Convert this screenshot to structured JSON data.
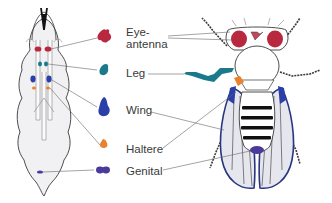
{
  "figure": {
    "left_panel": "larva",
    "right_panel": "adult fly"
  },
  "discs": [
    {
      "id": "eye-antenna",
      "label_line1": "Eye-",
      "label_line2": "antenna",
      "color": "#b8283e"
    },
    {
      "id": "leg",
      "label": "Leg",
      "color": "#1a7a8c"
    },
    {
      "id": "wing",
      "label": "Wing",
      "color": "#2a3fa8"
    },
    {
      "id": "haltere",
      "label": "Haltere",
      "color": "#e8822e"
    },
    {
      "id": "genital",
      "label": "Genital",
      "color": "#4a3a9a"
    }
  ],
  "colors": {
    "outline": "#3a3a3a",
    "body_fill": "#f2f2f4",
    "leader_line": "#666666",
    "wing_fill": "#e6e7ee",
    "wing_outline": "#2a3580"
  }
}
